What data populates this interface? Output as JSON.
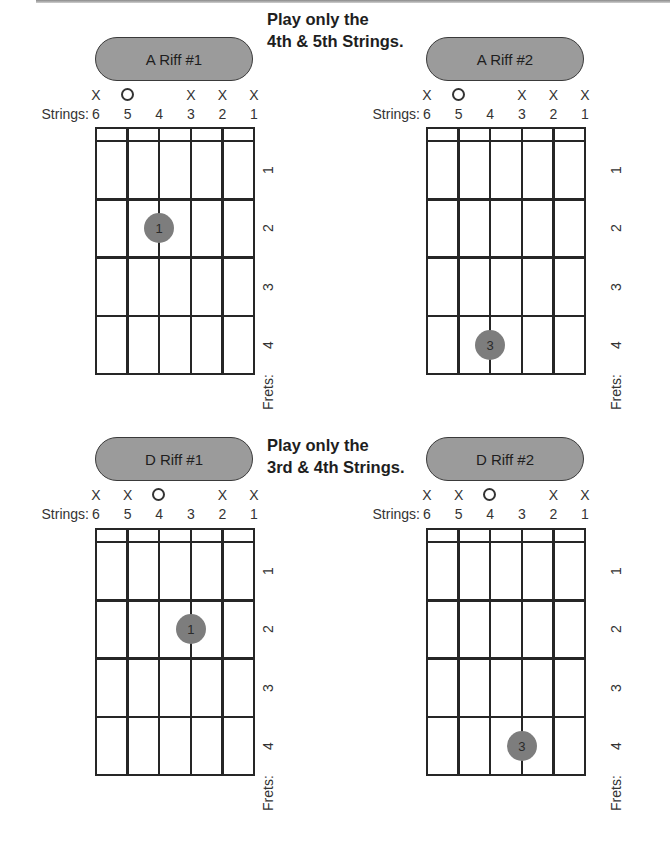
{
  "instructions": [
    {
      "line1": "Play only the",
      "line2": "4th & 5th Strings."
    },
    {
      "line1": "Play only the",
      "line2": "3rd & 4th Strings."
    }
  ],
  "strings_label": "Strings:",
  "frets_label": "Frets:",
  "string_numbers": [
    "6",
    "5",
    "4",
    "3",
    "2",
    "1"
  ],
  "fret_numbers": [
    "1",
    "2",
    "3",
    "4"
  ],
  "colors": {
    "pill_fill": "#9b9b9b",
    "dot_fill": "#7d7d7d",
    "grid_line": "#262626"
  },
  "charts": [
    {
      "title": "A Riff #1",
      "markers": [
        "X",
        "O",
        "",
        "X",
        "X",
        "X"
      ],
      "dots": [
        {
          "string": 4,
          "fret": 2,
          "finger": "1"
        }
      ]
    },
    {
      "title": "A Riff #2",
      "markers": [
        "X",
        "O",
        "",
        "X",
        "X",
        "X"
      ],
      "dots": [
        {
          "string": 4,
          "fret": 4,
          "finger": "3"
        }
      ]
    },
    {
      "title": "D Riff #1",
      "markers": [
        "X",
        "X",
        "O",
        "",
        "X",
        "X"
      ],
      "dots": [
        {
          "string": 3,
          "fret": 2,
          "finger": "1"
        }
      ]
    },
    {
      "title": "D Riff #2",
      "markers": [
        "X",
        "X",
        "O",
        "",
        "X",
        "X"
      ],
      "dots": [
        {
          "string": 3,
          "fret": 4,
          "finger": "3"
        }
      ]
    }
  ]
}
